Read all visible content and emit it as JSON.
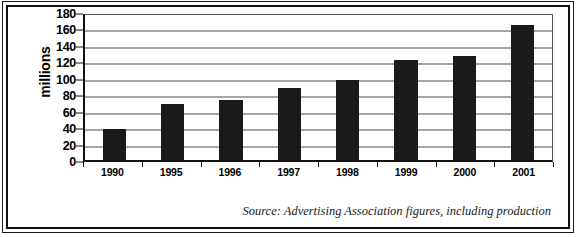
{
  "chart_data": {
    "type": "bar",
    "title": "",
    "xlabel": "",
    "ylabel": "millions",
    "categories": [
      "1990",
      "1995",
      "1996",
      "1997",
      "1998",
      "1999",
      "2000",
      "2001"
    ],
    "values": [
      38,
      68,
      73,
      88,
      97,
      122,
      127,
      164
    ],
    "ylim": [
      0,
      180
    ],
    "ytick_step": 20,
    "yticks": [
      "180",
      "160",
      "140",
      "120",
      "100",
      "80",
      "60",
      "40",
      "20",
      "0"
    ],
    "grid": true,
    "legend": false,
    "bar_color": "#1a1a1a",
    "gridline_color": "#4c4c4c",
    "plot_background": "#ffffff",
    "annotation": "Source: Advertising Association figures, including production"
  },
  "figure": {
    "source_note": "Source: Advertising Association figures, including production",
    "axis_label_y": "millions"
  }
}
